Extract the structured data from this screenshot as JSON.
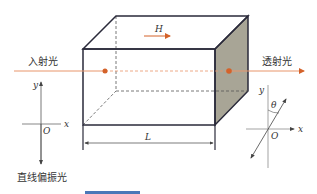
{
  "figure": {
    "incident_label": "入射光",
    "transmitted_label": "透射光",
    "polarized_label": "直线偏振光",
    "field_label": "H",
    "length_label": "L",
    "left_axes": {
      "y_label": "y",
      "x_label": "x",
      "origin_label": "O"
    },
    "right_axes": {
      "y_label": "y",
      "x_label": "x",
      "origin_label": "O",
      "angle_label": "θ"
    }
  },
  "colors": {
    "ray": "#e8956a",
    "dot": "#d4622a",
    "edge": "#2a2a3a",
    "shaded_face": "#a8a596",
    "axis": "#555555",
    "accent_bar": "#4a78b8"
  }
}
